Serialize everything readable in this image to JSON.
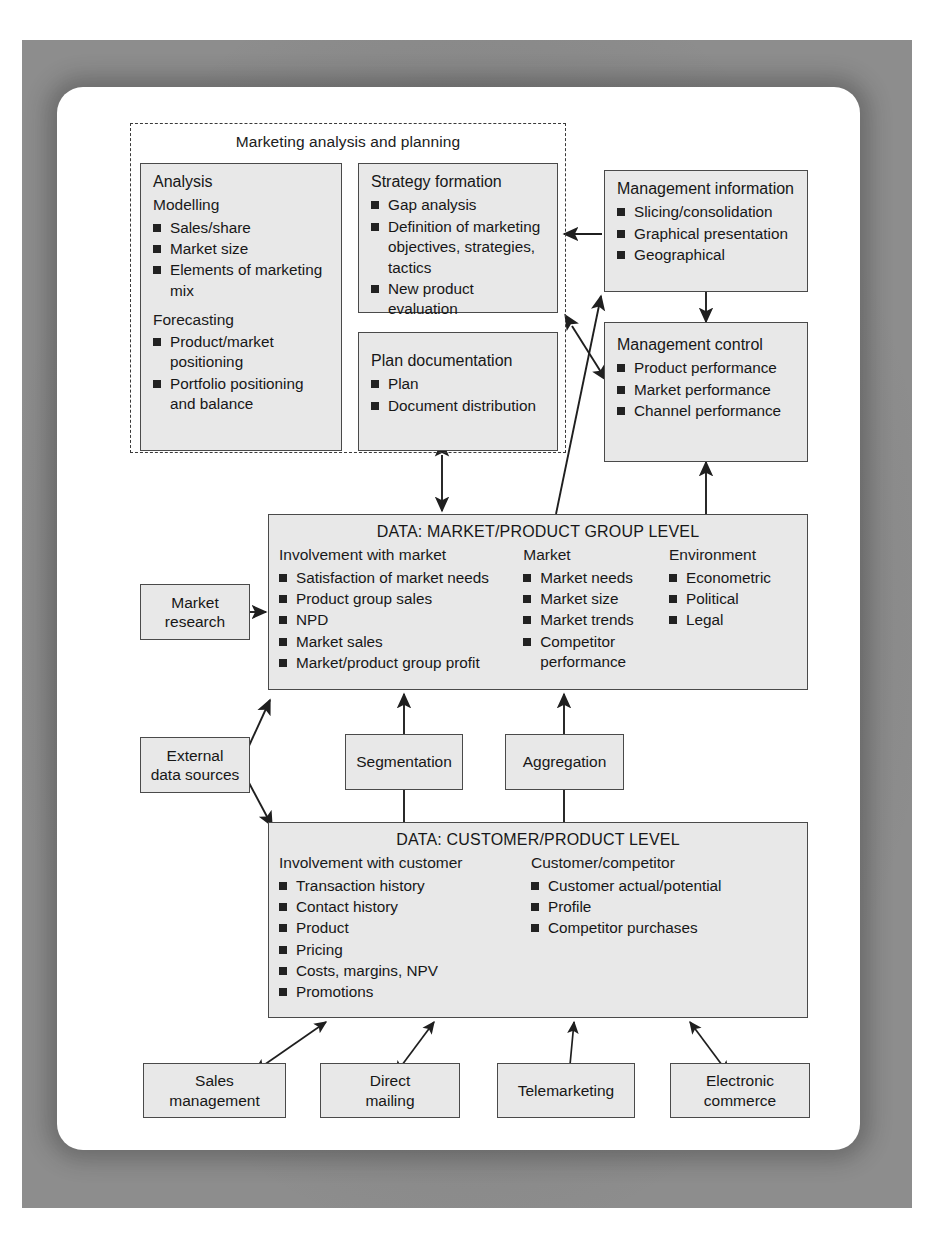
{
  "diagram": {
    "group": {
      "title": "Marketing analysis and planning"
    },
    "boxes": {
      "analysis": {
        "title": "Analysis",
        "section1": "Modelling",
        "items1": [
          "Sales/share",
          "Market size",
          "Elements of marketing mix"
        ],
        "section2": "Forecasting",
        "items2": [
          "Product/market positioning",
          "Portfolio positioning and balance"
        ]
      },
      "strategy_formation": {
        "title": "Strategy formation",
        "items": [
          "Gap analysis",
          "Definition of marketing objectives, strategies, tactics",
          "New product evaluation"
        ]
      },
      "plan_documentation": {
        "title": "Plan documentation",
        "items": [
          "Plan",
          "Document distribution"
        ]
      },
      "management_information": {
        "title": "Management information",
        "items": [
          "Slicing/consolidation",
          "Graphical presentation",
          "Geographical"
        ]
      },
      "management_control": {
        "title": "Management control",
        "items": [
          "Product performance",
          "Market performance",
          "Channel performance"
        ]
      },
      "market_product_group_level": {
        "title": "DATA: MARKET/PRODUCT GROUP LEVEL",
        "columns": [
          {
            "heading": "Involvement with market",
            "items": [
              "Satisfaction of market needs",
              "Product group sales",
              "NPD",
              "Market sales",
              "Market/product group profit"
            ]
          },
          {
            "heading": "Market",
            "items": [
              "Market needs",
              "Market size",
              "Market trends",
              "Competitor performance"
            ]
          },
          {
            "heading": "Environment",
            "items": [
              "Econometric",
              "Political",
              "Legal"
            ]
          }
        ]
      },
      "customer_product_level": {
        "title": "DATA: CUSTOMER/PRODUCT LEVEL",
        "columns": [
          {
            "heading": "Involvement with customer",
            "items": [
              "Transaction history",
              "Contact history",
              "Product",
              "Pricing",
              "Costs, margins, NPV",
              "Promotions"
            ]
          },
          {
            "heading": "Customer/competitor",
            "items": [
              "Customer actual/potential",
              "Profile",
              "Competitor purchases"
            ]
          }
        ]
      },
      "market_research": {
        "label": "Market\nresearch"
      },
      "external_data_sources": {
        "label": "External\ndata sources"
      },
      "segmentation": {
        "label": "Segmentation"
      },
      "aggregation": {
        "label": "Aggregation"
      },
      "sales_management": {
        "label": "Sales\nmanagement"
      },
      "direct_mailing": {
        "label": "Direct\nmailing"
      },
      "telemarketing": {
        "label": "Telemarketing"
      },
      "electronic_commerce": {
        "label": "Electronic\ncommerce"
      }
    },
    "colors": {
      "box_fill": "#e8e8e8",
      "box_stroke": "#4a4a4a",
      "line": "#1f1f1f",
      "plate": "#8d8d8d",
      "card": "#ffffff"
    }
  }
}
